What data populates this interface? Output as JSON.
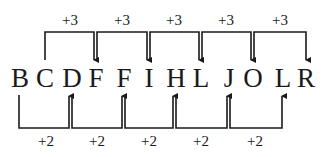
{
  "letters": [
    "B",
    "C",
    "D",
    "F",
    "F",
    "I",
    "H",
    "L",
    "J",
    "O",
    "L",
    "R"
  ],
  "top_steps": [
    "+3",
    "+3",
    "+3",
    "+3",
    "+3"
  ],
  "bottom_steps": [
    "+2",
    "+2",
    "+2",
    "+2",
    "+2"
  ],
  "series": {
    "top_series": {
      "rule": "+3",
      "sequence": [
        "C",
        "F",
        "I",
        "L",
        "O",
        "R"
      ]
    },
    "bottom_series": {
      "rule": "+2",
      "sequence": [
        "B",
        "D",
        "F",
        "H",
        "J",
        "L"
      ]
    }
  },
  "colors": {
    "line": "#1a1a1a",
    "background": "#ffffff"
  }
}
